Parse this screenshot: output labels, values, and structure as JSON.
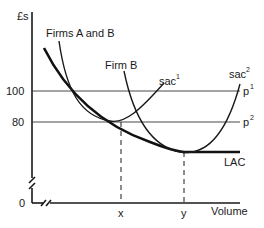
{
  "diagram": {
    "y_axis_label": "£s",
    "x_axis_label": "Volume",
    "y_ticks": [
      {
        "label": "100",
        "price_line": "p",
        "price_sup": "1"
      },
      {
        "label": "80",
        "price_line": "p",
        "price_sup": "2"
      },
      {
        "label": "0"
      }
    ],
    "x_ticks": [
      "x",
      "y"
    ],
    "curve_labels": {
      "firms_ab": "Firms A and B",
      "firm_b": "Firm B",
      "sac1": "sac",
      "sac1_sup": "1",
      "sac2": "sac",
      "sac2_sup": "2",
      "lac": "LAC"
    },
    "colors": {
      "ink": "#1a1a1a",
      "background": "#ffffff"
    }
  }
}
